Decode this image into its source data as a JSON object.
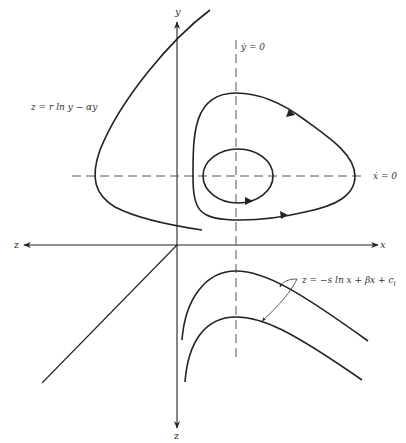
{
  "diagram": {
    "type": "phase-plane-3d-projection",
    "axes": {
      "y_label": "y",
      "x_label": "x",
      "z_left_label": "z",
      "z_bottom_label": "z"
    },
    "nullclines": {
      "vertical_label": "ẏ = 0",
      "horizontal_label": "ẋ = 0"
    },
    "equations": {
      "left_curve": {
        "lhs": "z",
        "text": "z = r ln y − αy"
      },
      "lower_curves": {
        "text": "z = −s ln x + βx + c",
        "subscript": "i"
      }
    },
    "orbits": [
      {
        "name": "inner-orbit",
        "direction": "counterclockwise"
      },
      {
        "name": "outer-orbit",
        "direction": "counterclockwise"
      }
    ],
    "colors": {
      "line": "#222222",
      "dash": "#555555",
      "background": "#ffffff"
    }
  }
}
